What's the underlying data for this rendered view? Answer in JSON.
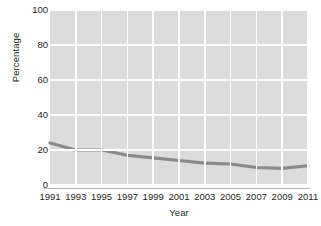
{
  "chart_data": {
    "type": "line",
    "title": "",
    "xlabel": "Year",
    "ylabel": "Percentage",
    "x": [
      1991,
      1993,
      1995,
      1997,
      1999,
      2001,
      2003,
      2005,
      2007,
      2009,
      2011
    ],
    "series": [
      {
        "name": "Percentage",
        "values": [
          24,
          20,
          20,
          17,
          15.5,
          14,
          12.5,
          12,
          10,
          9.5,
          11
        ]
      }
    ],
    "xtick_labels": [
      "1991",
      "1993",
      "1995",
      "1997",
      "1999",
      "2001",
      "2003",
      "2005",
      "2007",
      "2009",
      "2011"
    ],
    "ytick_labels": [
      "0",
      "20",
      "40",
      "60",
      "80",
      "100"
    ],
    "ytick_values": [
      0,
      20,
      40,
      60,
      80,
      100
    ],
    "xlim": [
      1991,
      2011
    ],
    "ylim": [
      0,
      100
    ],
    "grid": true,
    "grid_color": "#fdfdfd",
    "plot_background": "#dcdcdc",
    "line_color": "#8a8a8a",
    "line_width": 3.2,
    "legend": false,
    "legend_position": "none"
  }
}
